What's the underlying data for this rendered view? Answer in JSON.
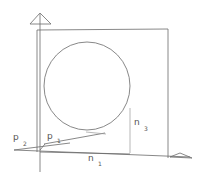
{
  "diagram": {
    "colors": {
      "line": "#6a6a6a",
      "text": "#555555",
      "background": "#ffffff"
    },
    "labels": {
      "p2": {
        "main": "p",
        "sub": "2"
      },
      "p1": {
        "main": "p",
        "sub": "1"
      },
      "n3": {
        "main": "n",
        "sub": "3"
      },
      "n1": {
        "main": "n",
        "sub": "1"
      }
    },
    "shapes": {
      "vertical_axis": "arrow-up",
      "horizontal_axis": "arrow-right",
      "plane": "rectangle",
      "object": "circle"
    }
  }
}
